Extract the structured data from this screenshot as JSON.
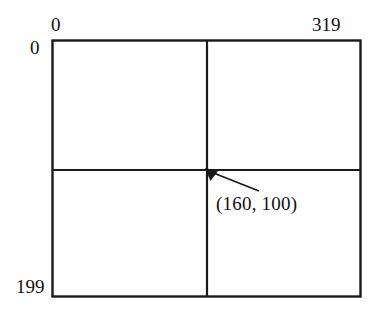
{
  "figure": {
    "background_color": "#ffffff",
    "line_color": "#1a1a1a",
    "text_color": "#121212"
  },
  "labels": {
    "top_left": "0",
    "top_right": "319",
    "left_top": "0",
    "left_bottom": "199",
    "point_annotation": "(160,  100)"
  },
  "diagram_data": {
    "type": "coordinate-grid",
    "box": {
      "x": 52,
      "y": 40,
      "width": 309,
      "height": 257
    },
    "divider_vertical_x": 207,
    "divider_horizontal_y": 170,
    "x_axis_range": [
      0,
      319
    ],
    "y_axis_range": [
      0,
      199
    ],
    "annotated_point": {
      "x": 160,
      "y": 100
    },
    "arrow": {
      "tip": {
        "x": 206,
        "y": 169
      },
      "tail": {
        "x": 259,
        "y": 191
      }
    }
  }
}
